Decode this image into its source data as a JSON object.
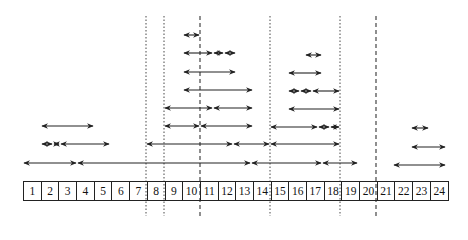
{
  "diagram": {
    "cells": [
      "1",
      "2",
      "3",
      "4",
      "5",
      "6",
      "7",
      "8",
      "9",
      "10",
      "11",
      "12",
      "13",
      "14",
      "15",
      "16",
      "17",
      "18",
      "19",
      "20",
      "21",
      "22",
      "23",
      "24"
    ],
    "cell_geometry": {
      "left": 23,
      "top": 181,
      "width": 17.7,
      "height": 20
    },
    "vertical_lines": [
      {
        "x": 146,
        "style": "dotted",
        "between": "7|8"
      },
      {
        "x": 164,
        "style": "dotted",
        "between": "8|9"
      },
      {
        "x": 200,
        "style": "dashed",
        "between": "10|11"
      },
      {
        "x": 270,
        "style": "dotted",
        "between": "14|15"
      },
      {
        "x": 340,
        "style": "dotted",
        "between": "18|19"
      },
      {
        "x": 376,
        "style": "dashed",
        "between": "20|21"
      }
    ],
    "vertical_line_top": 16,
    "vertical_line_bottom": 216,
    "arrows": [
      {
        "y": 35,
        "x1": 183,
        "x2": 200
      },
      {
        "y": 53,
        "x1": 183,
        "x2": 213
      },
      {
        "y": 53,
        "x1": 213,
        "x2": 224
      },
      {
        "y": 53,
        "x1": 224,
        "x2": 236
      },
      {
        "y": 55,
        "x1": 305,
        "x2": 322
      },
      {
        "y": 72,
        "x1": 183,
        "x2": 236
      },
      {
        "y": 73,
        "x1": 288,
        "x2": 322
      },
      {
        "y": 90,
        "x1": 183,
        "x2": 253
      },
      {
        "y": 91,
        "x1": 288,
        "x2": 300
      },
      {
        "y": 91,
        "x1": 300,
        "x2": 312
      },
      {
        "y": 91,
        "x1": 312,
        "x2": 340
      },
      {
        "y": 108,
        "x1": 164,
        "x2": 213
      },
      {
        "y": 108,
        "x1": 213,
        "x2": 253
      },
      {
        "y": 109,
        "x1": 288,
        "x2": 340
      },
      {
        "y": 126,
        "x1": 41,
        "x2": 94
      },
      {
        "y": 126,
        "x1": 164,
        "x2": 200
      },
      {
        "y": 126,
        "x1": 200,
        "x2": 253
      },
      {
        "y": 127,
        "x1": 270,
        "x2": 318
      },
      {
        "y": 127,
        "x1": 318,
        "x2": 330
      },
      {
        "y": 127,
        "x1": 330,
        "x2": 340
      },
      {
        "y": 128,
        "x1": 411,
        "x2": 429
      },
      {
        "y": 144,
        "x1": 41,
        "x2": 53
      },
      {
        "y": 144,
        "x1": 53,
        "x2": 60
      },
      {
        "y": 144,
        "x1": 60,
        "x2": 110
      },
      {
        "y": 144,
        "x1": 146,
        "x2": 233
      },
      {
        "y": 144,
        "x1": 233,
        "x2": 270
      },
      {
        "y": 144,
        "x1": 270,
        "x2": 340
      },
      {
        "y": 147,
        "x1": 411,
        "x2": 446
      },
      {
        "y": 163,
        "x1": 23,
        "x2": 77
      },
      {
        "y": 163,
        "x1": 77,
        "x2": 251
      },
      {
        "y": 163,
        "x1": 251,
        "x2": 322
      },
      {
        "y": 163,
        "x1": 322,
        "x2": 358
      },
      {
        "y": 165,
        "x1": 393,
        "x2": 446
      }
    ],
    "colors": {
      "line": "#333333",
      "arrow": "#222222",
      "border": "#222222",
      "text": "#111111"
    }
  }
}
